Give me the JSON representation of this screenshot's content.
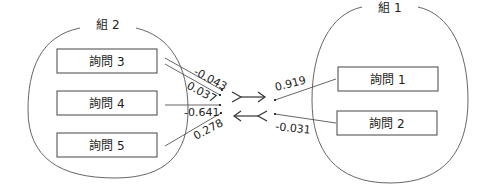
{
  "diagram": {
    "groups": [
      {
        "id": "group2",
        "label": "組 2",
        "items": [
          "詢問 3",
          "詢問 4",
          "詢問 5"
        ]
      },
      {
        "id": "group1",
        "label": "組 1",
        "items": [
          "詢問 1",
          "詢問 2"
        ]
      }
    ],
    "coefficients": {
      "q3_a": "-0.043",
      "q3_b": "0.037",
      "q4": "-0.641",
      "q5": "0.278",
      "q1": "0.919",
      "q2": "-0.031"
    },
    "colors": {
      "line": "#555555",
      "text": "#222222"
    }
  }
}
